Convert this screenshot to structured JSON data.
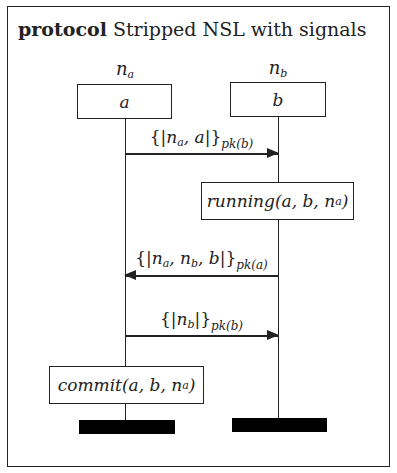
{
  "title": {
    "keyword": "protocol",
    "name": "Stripped NSL with signals"
  },
  "roles": [
    {
      "id": "a",
      "nonce_label": "n",
      "nonce_sub": "a",
      "role_label": "a"
    },
    {
      "id": "b",
      "nonce_label": "n",
      "nonce_sub": "b",
      "role_label": "b"
    }
  ],
  "messages": [
    {
      "from": "a",
      "to": "b",
      "open": "{|",
      "content": "n",
      "content_sub": "a",
      "content_rest": ", a",
      "close": "|}",
      "key": "pk(b)"
    },
    {
      "from": "b",
      "to": "a",
      "open": "{|",
      "content": "n",
      "content_sub": "a",
      "content_rest": ", n",
      "content_sub2": "b",
      "content_rest2": ", b",
      "close": "|}",
      "key": "pk(a)"
    },
    {
      "from": "a",
      "to": "b",
      "open": "{|",
      "content": "n",
      "content_sub": "b",
      "content_rest": "",
      "close": "|}",
      "key": "pk(b)"
    }
  ],
  "signals": [
    {
      "role": "b",
      "name": "running",
      "args_pre": "(a, b, n",
      "args_sub": "a",
      "args_post": ")"
    },
    {
      "role": "a",
      "name": "commit",
      "args_pre": "(a, b, n",
      "args_sub": "a",
      "args_post": ")"
    }
  ]
}
